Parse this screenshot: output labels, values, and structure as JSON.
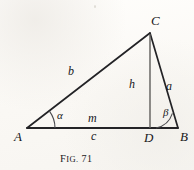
{
  "figure": {
    "caption_prefix": "Fig.",
    "caption_prefix_first": "F",
    "caption_prefix_rest": "ig.",
    "caption_number": "71",
    "caption_full": "FIG. 71"
  },
  "vertices": [
    {
      "key": "A",
      "label": "A",
      "name": "vertex-label-a",
      "x": 27,
      "y": 128,
      "label_x": 14,
      "label_y": 130
    },
    {
      "key": "B",
      "label": "B",
      "name": "vertex-label-b",
      "x": 178,
      "y": 128,
      "label_x": 180,
      "label_y": 130
    },
    {
      "key": "C",
      "label": "C",
      "name": "vertex-label-c",
      "x": 150,
      "y": 33,
      "label_x": 152,
      "label_y": 16
    },
    {
      "key": "D",
      "label": "D",
      "name": "vertex-label-d",
      "x": 150,
      "y": 128,
      "label_x": 145,
      "label_y": 131
    }
  ],
  "sides": [
    {
      "key": "b",
      "label": "b",
      "name": "side-label-b",
      "label_x": 68,
      "label_y": 66,
      "desc": "side AC"
    },
    {
      "key": "a",
      "label": "a",
      "name": "side-label-a",
      "label_x": 166,
      "label_y": 80,
      "desc": "side CB"
    },
    {
      "key": "h",
      "label": "h",
      "name": "side-label-h",
      "label_x": 129,
      "label_y": 78,
      "desc": "altitude CD"
    },
    {
      "key": "m",
      "label": "m",
      "name": "side-label-m",
      "label_x": 88,
      "label_y": 112,
      "desc": "segment AD"
    },
    {
      "key": "c",
      "label": "c",
      "name": "side-label-c",
      "label_x": 90,
      "label_y": 131,
      "desc": "base AB"
    }
  ],
  "angles": [
    {
      "key": "alpha",
      "label": "α",
      "name": "angle-label-alpha",
      "vertex": "A",
      "label_x": 57,
      "label_y": 110,
      "degrees": 32
    },
    {
      "key": "beta",
      "label": "β",
      "name": "angle-label-beta",
      "vertex": "B",
      "label_x": 163,
      "label_y": 107,
      "degrees": 74
    }
  ],
  "geometry": {
    "triangle_path": "M 27 128 L 150 33 L 178 128 Z",
    "altitude_path": "M 150 33 L 150 128",
    "base_path": "M 27 128 L 178 128",
    "alpha_arc_path": "M 55 128 A 28 28 0 0 0 49.3 111.3",
    "beta_arc_path": "M 156 128 A 22 22 0 0 0 172.2 113.1"
  },
  "colors": {
    "ink": "#17171a",
    "line": "#232326",
    "altitude_line": "#5c5a58",
    "arc": "#4a4a4e",
    "paper": "#fdfcfa"
  }
}
